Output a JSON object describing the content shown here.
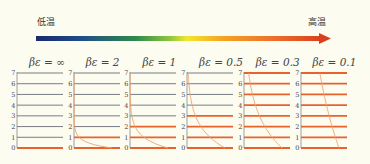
{
  "header": {
    "low_label": "低温",
    "high_label": "高温",
    "gradient_colors": [
      "#1a2a6e",
      "#1f4a9a",
      "#2e8a4a",
      "#8dc63f",
      "#f2e630",
      "#f5a623",
      "#e8502a",
      "#d9411e"
    ]
  },
  "chart_data": {
    "type": "diagram",
    "title": "",
    "levels": [
      0,
      1,
      2,
      3,
      4,
      5,
      6,
      7
    ],
    "panels": [
      {
        "label": "βε = ∞",
        "beta_eps": "inf",
        "occupied_levels": [
          0
        ],
        "populations": [
          1,
          0,
          0,
          0,
          0,
          0,
          0,
          0
        ]
      },
      {
        "label": "βε = 2",
        "beta_eps": 2,
        "occupied_levels": [
          0,
          1
        ],
        "populations": [
          1.0,
          0.135,
          0.018,
          0.002,
          0,
          0,
          0,
          0
        ]
      },
      {
        "label": "βε = 1",
        "beta_eps": 1,
        "occupied_levels": [
          0,
          1,
          2
        ],
        "populations": [
          1.0,
          0.368,
          0.135,
          0.05,
          0.018,
          0.007,
          0.002,
          0.001
        ]
      },
      {
        "label": "βε = 0.5",
        "beta_eps": 0.5,
        "occupied_levels": [
          0,
          1,
          2,
          3
        ],
        "populations": [
          1.0,
          0.607,
          0.368,
          0.223,
          0.135,
          0.082,
          0.05,
          0.03
        ]
      },
      {
        "label": "βε = 0.3",
        "beta_eps": 0.3,
        "occupied_levels": [
          0,
          1,
          2,
          3,
          4,
          5,
          6,
          7
        ],
        "populations": [
          1.0,
          0.741,
          0.549,
          0.407,
          0.301,
          0.223,
          0.165,
          0.122
        ]
      },
      {
        "label": "βε = 0.1",
        "beta_eps": 0.1,
        "occupied_levels": [
          0,
          1,
          2,
          3,
          4,
          5,
          6,
          7
        ],
        "populations": [
          1.0,
          0.905,
          0.819,
          0.741,
          0.67,
          0.607,
          0.549,
          0.497
        ]
      }
    ],
    "colors": {
      "occupied_level": "#e8622c",
      "empty_level": "#6a6f78",
      "curve": "#eea06a",
      "axis": "#777777"
    }
  }
}
